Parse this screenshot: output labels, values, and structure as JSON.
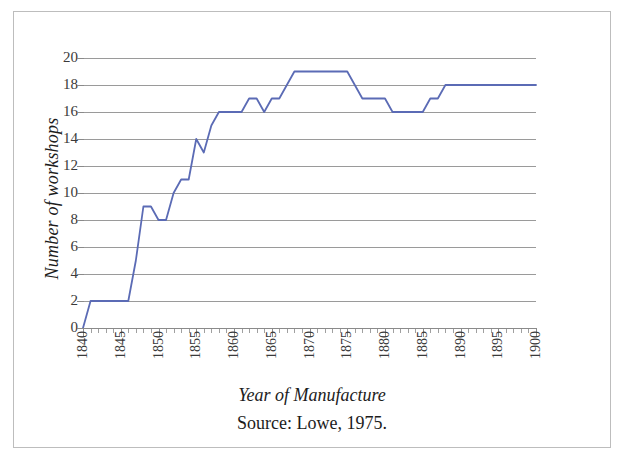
{
  "chart_data": {
    "type": "line",
    "title": "",
    "xlabel": "Year of Manufacture",
    "ylabel": "Number of workshops",
    "caption": "Source: Lowe, 1975.",
    "series_color": "#5b6bb5",
    "grid": true,
    "legend": "none",
    "xlim": [
      1840,
      1900
    ],
    "ylim": [
      0,
      20
    ],
    "xtick_step_major": 5,
    "xtick_step_minor": 1,
    "ytick_step": 2,
    "xtick_labels": [
      "1840",
      "1845",
      "1850",
      "1855",
      "1860",
      "1865",
      "1870",
      "1875",
      "1880",
      "1885",
      "1890",
      "1895",
      "1900"
    ],
    "ytick_labels": [
      "0",
      "2",
      "4",
      "6",
      "8",
      "10",
      "12",
      "14",
      "16",
      "18",
      "20"
    ],
    "x": [
      1840,
      1841,
      1842,
      1843,
      1844,
      1845,
      1846,
      1847,
      1848,
      1849,
      1850,
      1851,
      1852,
      1853,
      1854,
      1855,
      1856,
      1857,
      1858,
      1859,
      1860,
      1861,
      1862,
      1863,
      1864,
      1865,
      1866,
      1867,
      1868,
      1869,
      1870,
      1871,
      1872,
      1873,
      1874,
      1875,
      1876,
      1877,
      1878,
      1879,
      1880,
      1881,
      1882,
      1883,
      1884,
      1885,
      1886,
      1887,
      1888,
      1889,
      1890,
      1891,
      1892,
      1893,
      1894,
      1895,
      1896,
      1897,
      1898,
      1899,
      1900
    ],
    "values": [
      0,
      2,
      2,
      2,
      2,
      2,
      2,
      5,
      9,
      9,
      8,
      8,
      10,
      11,
      11,
      14,
      13,
      15,
      16,
      16,
      16,
      16,
      17,
      17,
      16,
      17,
      17,
      18,
      19,
      19,
      19,
      19,
      19,
      19,
      19,
      19,
      18,
      17,
      17,
      17,
      17,
      16,
      16,
      16,
      16,
      16,
      17,
      17,
      18,
      18,
      18,
      18,
      18,
      18,
      18,
      18,
      18,
      18,
      18,
      18,
      18
    ]
  }
}
